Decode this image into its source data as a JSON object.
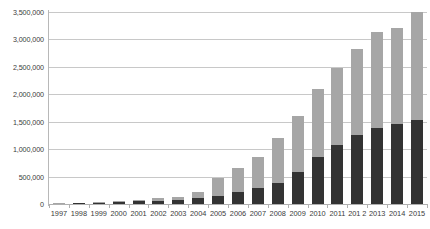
{
  "chart_data": {
    "type": "bar",
    "stacked": true,
    "title": "",
    "subtitle": "",
    "xlabel": "",
    "ylabel": "",
    "grid": true,
    "legend": "none",
    "ylim": [
      0,
      3500000
    ],
    "ytick_step": 500000,
    "ytick_labels": [
      "3,500,000",
      "3,000,000",
      "2,500,000",
      "2,000,000",
      "1,500,000",
      "1,000,000",
      "500,000",
      "0"
    ],
    "ytick_values": [
      3500000,
      3000000,
      2500000,
      2000000,
      1500000,
      1000000,
      500000,
      0
    ],
    "categories": [
      "1997",
      "1998",
      "1999",
      "2000",
      "2001",
      "2002",
      "2003",
      "2004",
      "2005",
      "2006",
      "2007",
      "2008",
      "2009",
      "2010",
      "2011",
      "201 2",
      "2013",
      "2014",
      "2015"
    ],
    "series": [
      {
        "name": "lower-segment",
        "color": "#333333",
        "values": [
          4000,
          12000,
          22000,
          34000,
          46000,
          60000,
          74000,
          110000,
          150000,
          215000,
          290000,
          380000,
          590000,
          860000,
          1080000,
          1250000,
          1380000,
          1450000,
          1530000
        ]
      },
      {
        "name": "upper-segment",
        "color": "#a6a6a6",
        "values": [
          3000,
          10000,
          18000,
          26000,
          34000,
          42000,
          56000,
          100000,
          330000,
          440000,
          560000,
          820000,
          1010000,
          1240000,
          1400000,
          1570000,
          1760000,
          1750000,
          1970000
        ]
      }
    ],
    "totals": [
      7000,
      22000,
      40000,
      60000,
      80000,
      102000,
      130000,
      210000,
      480000,
      655000,
      850000,
      1200000,
      1600000,
      2100000,
      2480000,
      2820000,
      3140000,
      3200000,
      3500000
    ]
  }
}
